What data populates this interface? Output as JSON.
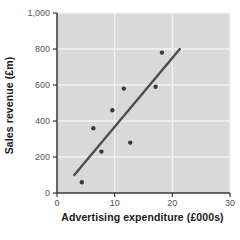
{
  "chart_data": {
    "type": "scatter",
    "xlabel": "Advertising expenditure (£000s)",
    "ylabel": "Sales revenue (£m)",
    "xlim": [
      0,
      30
    ],
    "ylim": [
      0,
      1000
    ],
    "x_ticks": [
      0,
      10,
      20,
      30
    ],
    "x_tick_labels": [
      "0",
      "10",
      "20",
      "30"
    ],
    "y_ticks": [
      0,
      200,
      400,
      600,
      800,
      1000
    ],
    "y_tick_labels": [
      "0",
      "200",
      "400",
      "600",
      "800",
      "1,000"
    ],
    "grid": true,
    "legend": "none",
    "points": [
      {
        "x": 4.3,
        "y": 60
      },
      {
        "x": 6.3,
        "y": 360
      },
      {
        "x": 7.7,
        "y": 230
      },
      {
        "x": 9.6,
        "y": 460
      },
      {
        "x": 11.6,
        "y": 580
      },
      {
        "x": 12.7,
        "y": 280
      },
      {
        "x": 17.1,
        "y": 590
      },
      {
        "x": 18.2,
        "y": 780
      }
    ],
    "trendline": {
      "x1": 3.0,
      "y1": 100,
      "x2": 21.3,
      "y2": 800
    },
    "colors": {
      "page_background": "#ffffff",
      "plot_background": "#d9d9d9",
      "gridline": "#f2f2f2",
      "axis": "#3a3a3a",
      "tick_label": "#555555",
      "axis_title": "#1a1a1a",
      "point": "#3a3a3a",
      "trendline": "#4d4d4d"
    }
  }
}
